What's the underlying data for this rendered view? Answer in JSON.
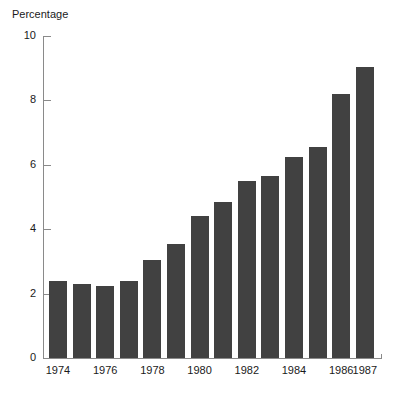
{
  "chart_data": {
    "type": "bar",
    "title": "",
    "subtitle": "",
    "xlabel": "",
    "ylabel": "Percentage",
    "ylim": [
      0,
      10
    ],
    "yticks": [
      0,
      2,
      4,
      6,
      8,
      10
    ],
    "ytick_labels": [
      "0",
      "2",
      "4",
      "6",
      "8",
      "10"
    ],
    "grid": false,
    "legend": null,
    "bar_color": "#414141",
    "axis_color": "#8a8a8a",
    "categories": [
      "1974",
      "1975",
      "1976",
      "1977",
      "1978",
      "1979",
      "1980",
      "1981",
      "1982",
      "1983",
      "1984",
      "1985",
      "1986",
      "1987"
    ],
    "xtick_labels": [
      "1974",
      "1976",
      "1978",
      "1980",
      "1982",
      "1984",
      "1986",
      "1987"
    ],
    "values": [
      2.4,
      2.3,
      2.25,
      2.4,
      3.05,
      3.55,
      4.4,
      4.85,
      5.5,
      5.65,
      6.25,
      6.55,
      8.2,
      9.05
    ]
  },
  "axis": {
    "y_title": "Percentage"
  }
}
